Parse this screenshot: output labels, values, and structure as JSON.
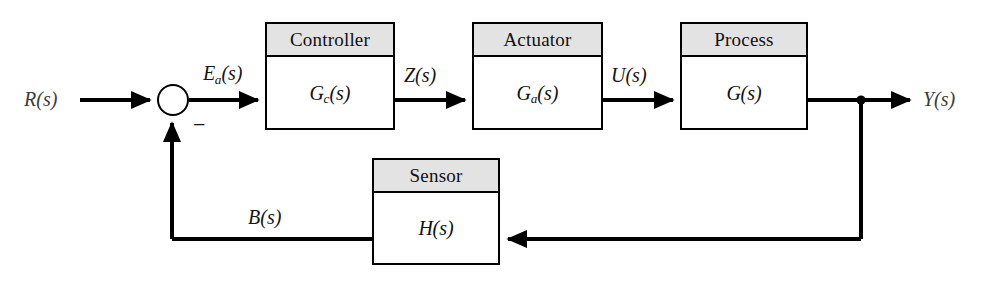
{
  "diagram": {
    "background_color": "#ffffff",
    "line_color": "#000000",
    "header_fill_color": "#e3e3e3",
    "block_fill_color": "#ffffff",
    "label_color": "#3c3c3c"
  },
  "blocks": [
    {
      "id": "controller",
      "header": "Controller",
      "transfer_var": "G",
      "transfer_sub": "c",
      "transfer_arg": "(s)"
    },
    {
      "id": "actuator",
      "header": "Actuator",
      "transfer_var": "G",
      "transfer_sub": "a",
      "transfer_arg": "(s)"
    },
    {
      "id": "process",
      "header": "Process",
      "transfer_var": "G",
      "transfer_sub": "",
      "transfer_arg": "(s)"
    },
    {
      "id": "sensor",
      "header": "Sensor",
      "transfer_var": "H",
      "transfer_sub": "",
      "transfer_arg": "(s)"
    }
  ],
  "signals": {
    "reference_input": "R(s)",
    "error": "E",
    "error_sub": "a",
    "error_arg": "(s)",
    "controller_output": "Z(s)",
    "actuator_output": "U(s)",
    "system_output": "Y(s)",
    "feedback": "B(s)",
    "summing_negative_sign": "−"
  }
}
